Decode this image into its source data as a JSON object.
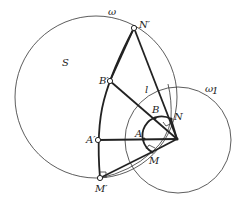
{
  "diagram": {
    "type": "geometry-figure",
    "circles": [
      {
        "name": "omega",
        "label": "ω",
        "cx": 96,
        "cy": 97,
        "r": 81
      },
      {
        "name": "omega1",
        "label": "ω₁",
        "cx": 178,
        "cy": 140,
        "r": 53
      }
    ],
    "region_label": "S",
    "points": {
      "N_prime": {
        "label": "N′",
        "x": 134,
        "y": 28
      },
      "B_prime": {
        "label": "B′",
        "x": 110,
        "y": 81
      },
      "A_prime": {
        "label": "A′",
        "x": 98,
        "y": 140
      },
      "M_prime": {
        "label": "M′",
        "x": 100,
        "y": 178
      },
      "O": {
        "label": "",
        "x": 177,
        "y": 139
      },
      "A": {
        "label": "A",
        "x": 144,
        "y": 139
      },
      "B": {
        "label": "B",
        "x": 155,
        "y": 118
      },
      "N": {
        "label": "N",
        "x": 171,
        "y": 119
      },
      "M": {
        "label": "M",
        "x": 152,
        "y": 152
      }
    },
    "line_label": "l",
    "labels": {
      "omega": "ω",
      "omega1": "ω",
      "omega1_sub": "1",
      "S": "S",
      "l": "l",
      "N_prime": "N′",
      "B_prime": "B′",
      "A_prime": "A′",
      "M_prime": "M′",
      "A": "A",
      "B": "B",
      "N": "N",
      "M": "M"
    }
  }
}
